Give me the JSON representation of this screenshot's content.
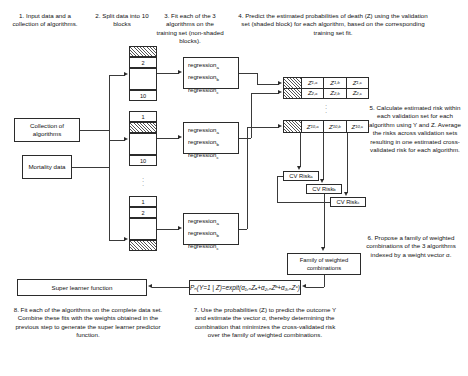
{
  "captions": {
    "step1": "1. Input data and a collection of algorithms.",
    "step2": "2. Split data into 10 blocks",
    "step3": "3. Fit each of the 3 algorithms on the training set (non-shaded blocks).",
    "step4": "4. Predict the estimated probabilities of death (Z) using the validation set (shaded block) for each algorithm, based on the corresponding training set fit.",
    "step5": "5. Calculate estimated risk within each validation set for each algorithm using Y and Z. Average the risks across validation sets resulting in one estimated cross-validated risk for each algorithm.",
    "step6": "6. Propose a family of weighted combinations of the 3 algorithms indexed by a weight vector α.",
    "step7": "7. Use the probabilities (Z) to predict the outcome Y and estimate the vector α, thereby determining the combination that minimizes the cross-validated risk over the family of weighted combinations.",
    "step8": "8. Fit each of the algorithms on the complete data set. Combine these fits with the weights obtained in the previous step to generate the super learner predictor function."
  },
  "inputs": {
    "collection_of_algorithms": "Collection of algorithms",
    "mortality_data": "Mortality data"
  },
  "blocks": {
    "stack1": [
      {
        "label": "",
        "shaded": true
      },
      {
        "label": "2",
        "shaded": false
      },
      {
        "label": "",
        "shaded": false,
        "spacer": true
      },
      {
        "label": "10",
        "shaded": false
      }
    ],
    "stack2": [
      {
        "label": "1",
        "shaded": false
      },
      {
        "label": "",
        "shaded": true
      },
      {
        "label": "",
        "shaded": false,
        "spacer": true
      },
      {
        "label": "10",
        "shaded": false
      }
    ],
    "stack3": [
      {
        "label": "1",
        "shaded": false
      },
      {
        "label": "2",
        "shaded": false
      },
      {
        "label": "",
        "shaded": false,
        "spacer": true
      },
      {
        "label": "",
        "shaded": true
      }
    ]
  },
  "regressions": {
    "set1": [
      "regression",
      "regression",
      "regression"
    ],
    "subscripts": [
      "a",
      "b",
      "c"
    ]
  },
  "z_tables": {
    "top": {
      "rows": [
        {
          "shaded": true,
          "cells": [
            "Z",
            "Z",
            "Z"
          ],
          "subs": [
            "1,a",
            "1,b",
            "1,c"
          ]
        },
        {
          "shaded": true,
          "cells": [
            "Z",
            "Z",
            "Z"
          ],
          "subs": [
            "2,a",
            "2,b",
            "2,c"
          ]
        }
      ]
    },
    "bottom": {
      "rows": [
        {
          "shaded": true,
          "cells": [
            "Z",
            "Z",
            "Z"
          ],
          "subs": [
            "10,a",
            "10,b",
            "10,c"
          ]
        }
      ]
    }
  },
  "cv_risks": {
    "a": "CV Risk",
    "b": "CV Risk",
    "c": "CV Risk",
    "sub_a": "a",
    "sub_b": "b",
    "sub_c": "c"
  },
  "family_box": "Family of weighted combinations",
  "formula": "Pₙ(Y=1 | Z)=expit(α₁,ₙZₐ+α₂,ₙZᵇ+α₃,ₙZᶜ)",
  "super_learner": "Super learner function",
  "vertical_dots": "⋮",
  "colors": {
    "line": "#2b2b2b",
    "text": "#111111",
    "background": "#ffffff",
    "hatch": "#555555"
  }
}
